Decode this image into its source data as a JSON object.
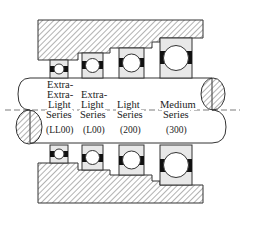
{
  "diagram": {
    "colors": {
      "line": "#333333",
      "hatch": "#555555",
      "bearing_fill": "#e8e8e8",
      "ball_fill": "#ffffff",
      "separator_fill": "#111111"
    },
    "series": [
      {
        "lines": [
          "Extra-",
          "Extra-",
          "Light",
          "Series"
        ],
        "code": "(LL00)"
      },
      {
        "lines": [
          "Extra-",
          "Light",
          "Series"
        ],
        "code": "(L00)"
      },
      {
        "lines": [
          "Light",
          "Series"
        ],
        "code": "(200)"
      },
      {
        "lines": [
          "Medium",
          "Series"
        ],
        "code": "(300)"
      }
    ]
  }
}
